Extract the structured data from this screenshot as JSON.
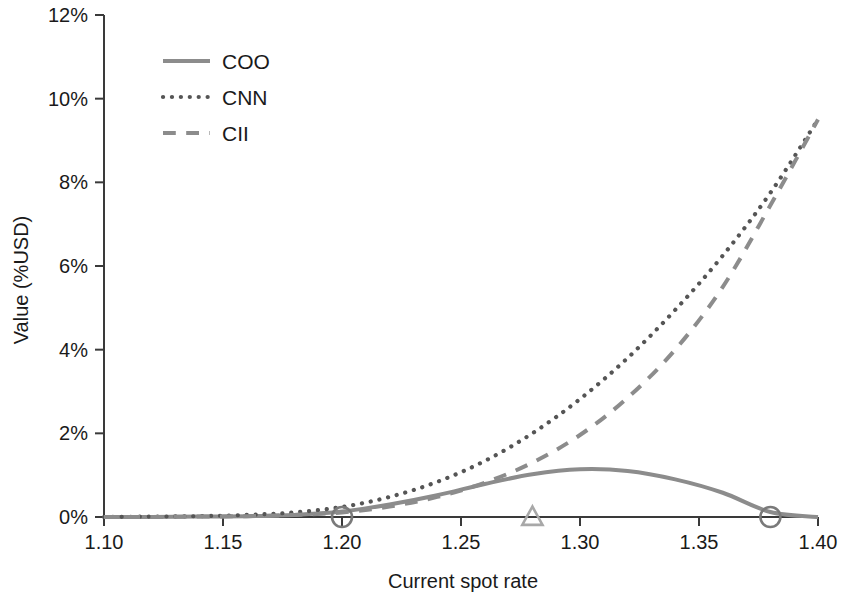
{
  "chart_data": {
    "type": "line",
    "title": "",
    "xlabel": "Current spot rate",
    "ylabel": "Value (%USD)",
    "xlim": [
      1.1,
      1.4
    ],
    "ylim": [
      0,
      12
    ],
    "x_ticks": [
      "1.10",
      "1.15",
      "1.20",
      "1.25",
      "1.30",
      "1.35",
      "1.40"
    ],
    "x_tick_values": [
      1.1,
      1.15,
      1.2,
      1.25,
      1.3,
      1.35,
      1.4
    ],
    "y_ticks": [
      "0%",
      "2%",
      "4%",
      "6%",
      "8%",
      "10%",
      "12%"
    ],
    "y_tick_values": [
      0,
      2,
      4,
      6,
      8,
      10,
      12
    ],
    "grid": false,
    "legend_position": "upper-left-inside",
    "x": [
      1.1,
      1.12,
      1.14,
      1.16,
      1.18,
      1.2,
      1.22,
      1.24,
      1.26,
      1.28,
      1.3,
      1.32,
      1.34,
      1.36,
      1.38,
      1.4
    ],
    "series": [
      {
        "name": "COO",
        "style": "solid",
        "color": "#8c8c8c",
        "values": [
          0.0,
          0.0,
          0.01,
          0.02,
          0.05,
          0.13,
          0.3,
          0.52,
          0.79,
          1.02,
          1.14,
          1.1,
          0.9,
          0.58,
          0.12,
          0.0
        ]
      },
      {
        "name": "CNN",
        "style": "dotted",
        "color": "#555555",
        "values": [
          0.0,
          0.01,
          0.02,
          0.05,
          0.11,
          0.24,
          0.48,
          0.84,
          1.34,
          2.0,
          2.82,
          3.8,
          4.95,
          6.25,
          7.75,
          9.5
        ]
      },
      {
        "name": "CII",
        "style": "dashed",
        "color": "#8c8c8c",
        "values": [
          0.0,
          0.0,
          0.01,
          0.02,
          0.05,
          0.11,
          0.25,
          0.48,
          0.82,
          1.3,
          1.96,
          2.85,
          4.0,
          5.5,
          7.45,
          9.5
        ]
      }
    ],
    "markers": [
      {
        "name": "lower-breakeven-marker",
        "shape": "circle",
        "x": 1.2,
        "y": 0,
        "color": "#7a7a7a",
        "filled": false
      },
      {
        "name": "strike-marker",
        "shape": "triangle",
        "x": 1.28,
        "y": 0,
        "color": "#a8a8a8",
        "filled": false
      },
      {
        "name": "upper-breakeven-marker",
        "shape": "circle",
        "x": 1.38,
        "y": 0,
        "color": "#7a7a7a",
        "filled": false
      }
    ]
  },
  "legend": {
    "items": [
      {
        "label": "COO"
      },
      {
        "label": "CNN"
      },
      {
        "label": "CII"
      }
    ]
  }
}
